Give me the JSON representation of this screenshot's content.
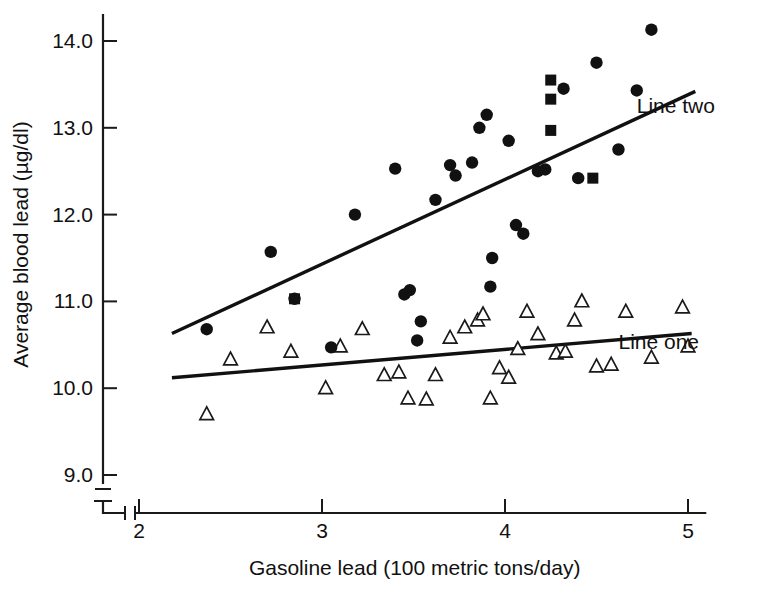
{
  "chart_data": {
    "type": "scatter",
    "title": "",
    "xlabel": "Gasoline lead (100 metric tons/day)",
    "ylabel": "Average blood lead (µg/dl)",
    "xlim": [
      2.0,
      5.1
    ],
    "ylim": [
      9.0,
      14.3
    ],
    "xticks": [
      2,
      3,
      4,
      5
    ],
    "xtick_labels": [
      "2",
      "3",
      "4",
      "5"
    ],
    "yticks": [
      9.0,
      10.0,
      11.0,
      12.0,
      13.0,
      14.0
    ],
    "ytick_labels": [
      "9.0",
      "10.0",
      "11.0",
      "12.0",
      "13.0",
      "14.0"
    ],
    "grid": false,
    "legend_position": "inline-right",
    "axis_break": true,
    "series": [
      {
        "name": "Line one",
        "marker": "open-triangle",
        "label": "Line one",
        "label_x": 4.62,
        "label_y": 10.53,
        "points": [
          [
            2.37,
            9.7
          ],
          [
            2.5,
            10.33
          ],
          [
            2.7,
            10.7
          ],
          [
            2.83,
            10.42
          ],
          [
            3.02,
            10.0
          ],
          [
            3.1,
            10.48
          ],
          [
            3.22,
            10.68
          ],
          [
            3.34,
            10.15
          ],
          [
            3.42,
            10.18
          ],
          [
            3.47,
            9.88
          ],
          [
            3.57,
            9.87
          ],
          [
            3.62,
            10.15
          ],
          [
            3.7,
            10.58
          ],
          [
            3.78,
            10.7
          ],
          [
            3.85,
            10.78
          ],
          [
            3.88,
            10.85
          ],
          [
            3.92,
            9.88
          ],
          [
            3.97,
            10.23
          ],
          [
            4.02,
            10.12
          ],
          [
            4.07,
            10.45
          ],
          [
            4.12,
            10.88
          ],
          [
            4.18,
            10.62
          ],
          [
            4.28,
            10.4
          ],
          [
            4.33,
            10.42
          ],
          [
            4.38,
            10.78
          ],
          [
            4.42,
            11.0
          ],
          [
            4.5,
            10.25
          ],
          [
            4.58,
            10.27
          ],
          [
            4.66,
            10.88
          ],
          [
            4.8,
            10.35
          ],
          [
            4.97,
            10.93
          ],
          [
            5.0,
            10.48
          ]
        ],
        "fit_line": {
          "x_start": 2.18,
          "y_start": 10.12,
          "x_end": 5.02,
          "y_end": 10.63
        }
      },
      {
        "name": "Line two",
        "marker": "filled-circle",
        "label": "Line two",
        "label_x": 4.72,
        "label_y": 13.25,
        "points": [
          [
            2.37,
            10.68
          ],
          [
            2.72,
            11.57
          ],
          [
            2.85,
            11.03
          ],
          [
            3.05,
            10.47
          ],
          [
            3.18,
            12.0
          ],
          [
            3.4,
            12.53
          ],
          [
            3.45,
            11.08
          ],
          [
            3.48,
            11.13
          ],
          [
            3.52,
            10.55
          ],
          [
            3.54,
            10.77
          ],
          [
            3.62,
            12.17
          ],
          [
            3.7,
            12.57
          ],
          [
            3.73,
            12.45
          ],
          [
            3.82,
            12.6
          ],
          [
            3.86,
            13.0
          ],
          [
            3.9,
            13.15
          ],
          [
            3.92,
            11.17
          ],
          [
            3.93,
            11.5
          ],
          [
            4.02,
            12.85
          ],
          [
            4.06,
            11.88
          ],
          [
            4.1,
            11.78
          ],
          [
            4.18,
            12.5
          ],
          [
            4.22,
            12.52
          ],
          [
            4.32,
            13.45
          ],
          [
            4.4,
            12.42
          ],
          [
            4.5,
            13.75
          ],
          [
            4.62,
            12.75
          ],
          [
            4.72,
            13.43
          ],
          [
            4.8,
            14.13
          ]
        ],
        "fit_line": {
          "x_start": 2.18,
          "y_start": 10.63,
          "x_end": 5.04,
          "y_end": 13.42
        }
      },
      {
        "name": "squares",
        "marker": "filled-square",
        "label": "",
        "points": [
          [
            2.85,
            11.03
          ],
          [
            4.25,
            13.55
          ],
          [
            4.25,
            13.33
          ],
          [
            4.25,
            12.97
          ],
          [
            4.48,
            12.42
          ]
        ]
      }
    ]
  }
}
